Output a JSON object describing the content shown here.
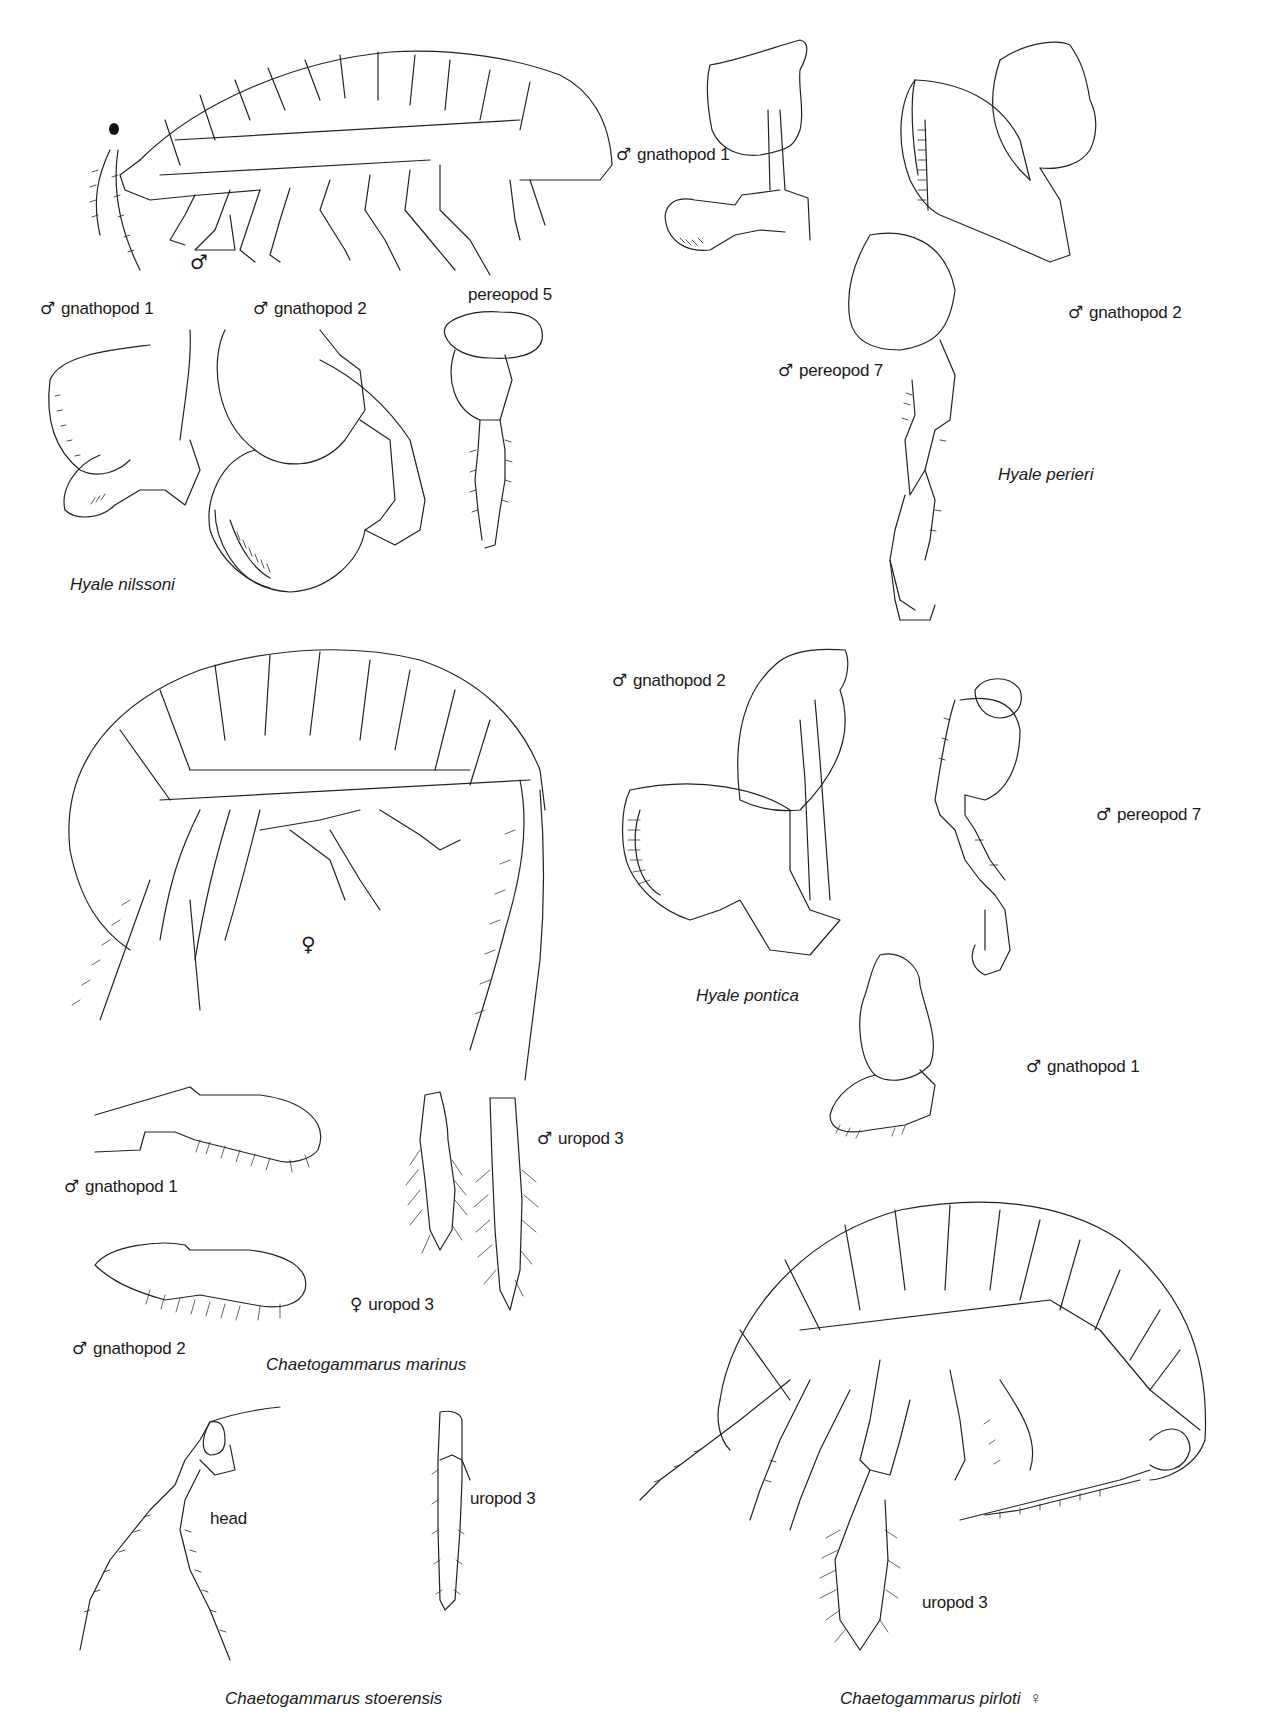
{
  "plate": {
    "species": [
      {
        "name": "Hyale nilssoni",
        "labels": {
          "whole_body_sex": "♂",
          "gnathopod_1": "gnathopod 1",
          "gnathopod_1_sex": "♂",
          "gnathopod_2": "gnathopod 2",
          "gnathopod_2_sex": "♂",
          "pereopod_5": "pereopod 5"
        }
      },
      {
        "name": "Hyale perieri",
        "labels": {
          "gnathopod_1": "gnathopod 1",
          "gnathopod_1_sex": "♂",
          "gnathopod_2": "gnathopod 2",
          "gnathopod_2_sex": "♂",
          "pereopod_7": "pereopod 7",
          "pereopod_7_sex": "♂"
        }
      },
      {
        "name": "Chaetogammarus marinus",
        "labels": {
          "whole_body_sex": "♀",
          "gnathopod_1": "gnathopod 1",
          "gnathopod_1_sex": "♂",
          "gnathopod_2": "gnathopod 2",
          "gnathopod_2_sex": "♂",
          "uropod_3_female": "uropod 3",
          "uropod_3_female_sex": "♀",
          "uropod_3_male": "uropod 3",
          "uropod_3_male_sex": "♂"
        }
      },
      {
        "name": "Hyale pontica",
        "labels": {
          "gnathopod_2": "gnathopod 2",
          "gnathopod_2_sex": "♂",
          "pereopod_7": "pereopod 7",
          "pereopod_7_sex": "♂",
          "gnathopod_1": "gnathopod 1",
          "gnathopod_1_sex": "♂"
        }
      },
      {
        "name": "Chaetogammarus stoerensis",
        "labels": {
          "head": "head",
          "uropod_3": "uropod 3"
        }
      },
      {
        "name": "Chaetogammarus pirloti",
        "name_sex": "♀",
        "labels": {
          "uropod_3": "uropod 3"
        }
      }
    ]
  }
}
